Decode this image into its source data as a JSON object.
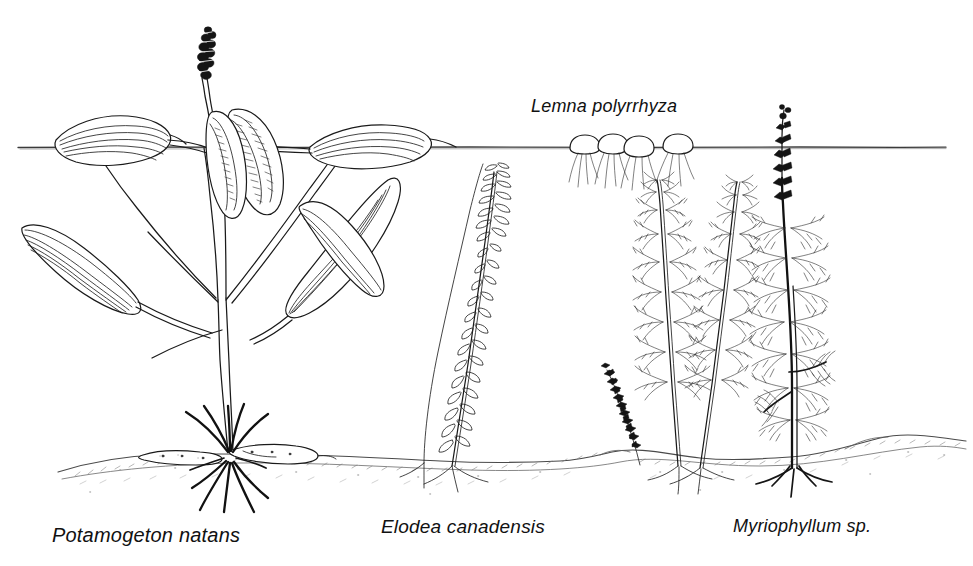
{
  "figure": {
    "background_color": "#ffffff",
    "ink_color": "#1a1a1a",
    "width": 973,
    "height": 566
  },
  "environment": {
    "water_surface": {
      "name": "water-surface-line",
      "y": 147,
      "x_start": 18,
      "x_end": 948,
      "color": "#3b3b3b"
    },
    "sediment": {
      "name": "sediment-bed",
      "y_average": 458,
      "x_start": 58,
      "x_end": 966,
      "color": "#4a4a4a",
      "texture": "stippled-hatched"
    }
  },
  "labels": {
    "potamogeton": "Potamogeton natans",
    "elodea": "Elodea canadensis",
    "myriophyllum": "Myriophyllum sp.",
    "lemna": "Lemna polyrrhyza"
  },
  "plants": [
    {
      "name": "potamogeton-natans",
      "label": "Potamogeton natans",
      "growth_form": "rooted floating-leaved",
      "position_x": 155,
      "features": [
        "floating elliptical surface leaves",
        "lanceolate submerged leaves with parallel veins",
        "emergent flower spike",
        "horizontal rhizome in sediment",
        "fibrous roots"
      ]
    },
    {
      "name": "elodea-canadensis",
      "label": "Elodea canadensis",
      "growth_form": "rooted submerged",
      "position_x": 470,
      "features": [
        "slender unbranched stem",
        "small whorled leaves along stem",
        "shallow root anchorage"
      ]
    },
    {
      "name": "lemna-polyrrhyza",
      "label": "Lemna polyrrhyza",
      "growth_form": "free-floating",
      "position_x": 600,
      "frond_count": 4,
      "features": [
        "oval floating fronds at water surface",
        "clusters of trailing unanchored roots"
      ]
    },
    {
      "name": "myriophyllum-sp",
      "label": "Myriophyllum sp.",
      "growth_form": "rooted submerged",
      "position_x": 790,
      "stem_count": 3,
      "features": [
        "finely dissected whorled pinnate leaves",
        "emergent flower spike on tallest stem",
        "rooted in sediment"
      ]
    }
  ]
}
